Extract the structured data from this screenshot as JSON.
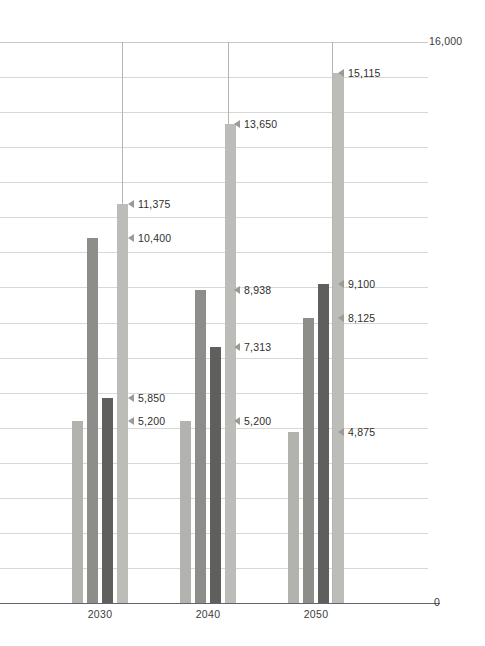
{
  "chart_data": {
    "type": "bar",
    "title": "",
    "subtitle": "",
    "xlabel": "",
    "ylabel": "",
    "ylim": [
      0,
      16000
    ],
    "y_axis_top_label": "16,000",
    "y_axis_zero_label": "0",
    "grid": true,
    "gridline_step": 1000,
    "legend_position": "none",
    "categories": [
      "2030",
      "2040",
      "2050"
    ],
    "series": [
      {
        "name": "series-1",
        "color": "#b2b2ae",
        "values": [
          5200,
          5200,
          4875
        ],
        "value_labels": [
          "5,200",
          "5,200",
          "4,875"
        ]
      },
      {
        "name": "series-2",
        "color": "#8d8d89",
        "values": [
          10400,
          8938,
          8125
        ],
        "value_labels": [
          "10,400",
          "8,938",
          "8,125"
        ]
      },
      {
        "name": "series-3",
        "color": "#5f5f5d",
        "values": [
          5850,
          7313,
          9100
        ],
        "value_labels": [
          "5,850",
          "7,313",
          "9,100"
        ]
      },
      {
        "name": "series-4",
        "color": "#bcbcb8",
        "values": [
          11375,
          13650,
          15115
        ],
        "value_labels": [
          "11,375",
          "13,650",
          "15,115"
        ]
      }
    ],
    "annotations": [
      {
        "label": "11,375",
        "value": 11375,
        "category": "2030",
        "series": "series-4"
      },
      {
        "label": "10,400",
        "value": 10400,
        "category": "2030",
        "series": "series-2"
      },
      {
        "label": "5,850",
        "value": 5850,
        "category": "2030",
        "series": "series-3"
      },
      {
        "label": "5,200",
        "value": 5200,
        "category": "2030",
        "series": "series-1"
      },
      {
        "label": "13,650",
        "value": 13650,
        "category": "2040",
        "series": "series-4"
      },
      {
        "label": "8,938",
        "value": 8938,
        "category": "2040",
        "series": "series-2"
      },
      {
        "label": "7,313",
        "value": 7313,
        "category": "2040",
        "series": "series-3"
      },
      {
        "label": "5,200",
        "value": 5200,
        "category": "2040",
        "series": "series-1"
      },
      {
        "label": "15,115",
        "value": 15115,
        "category": "2050",
        "series": "series-4"
      },
      {
        "label": "9,100",
        "value": 9100,
        "category": "2050",
        "series": "series-3"
      },
      {
        "label": "8,125",
        "value": 8125,
        "category": "2050",
        "series": "series-2"
      },
      {
        "label": "4,875",
        "value": 4875,
        "category": "2050",
        "series": "series-1"
      }
    ],
    "colors": {
      "gridline": "#d8d8d6",
      "separator": "#b5b5b2",
      "baseline": "#5d6470",
      "text": "#3c3c3c",
      "marker": "#9a9a97"
    }
  },
  "layout": {
    "plot_left": 0,
    "plot_top": 42,
    "plot_width": 428,
    "plot_height": 561,
    "baseline_y": 603,
    "group_centers": [
      100,
      208,
      316
    ],
    "bar_width": 11,
    "bar_gap": 4,
    "vlines_x": [
      122,
      228,
      332
    ],
    "callout_x": [
      128,
      234,
      338
    ]
  }
}
